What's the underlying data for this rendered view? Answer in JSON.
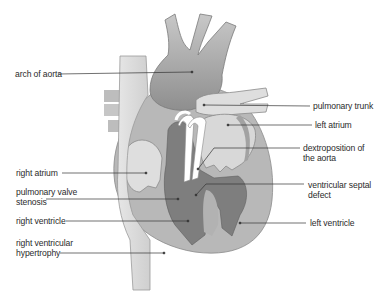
{
  "diagram": {
    "labels_left": [
      {
        "id": "arch-of-aorta",
        "line1": "arch of aorta",
        "line2": ""
      },
      {
        "id": "right-atrium",
        "line1": "right atrium",
        "line2": ""
      },
      {
        "id": "pulmonary-valve-stenosis",
        "line1": "pulmonary valve",
        "line2": "stenosis"
      },
      {
        "id": "right-ventricle",
        "line1": "right ventricle",
        "line2": ""
      },
      {
        "id": "right-ventricular-hypertrophy",
        "line1": "right ventricular",
        "line2": "hypertrophy"
      }
    ],
    "labels_right": [
      {
        "id": "pulmonary-trunk",
        "line1": "pulmonary trunk",
        "line2": ""
      },
      {
        "id": "left-atrium",
        "line1": "left atrium",
        "line2": ""
      },
      {
        "id": "dextroposition-of-aorta",
        "line1": "dextroposition of",
        "line2": "the aorta"
      },
      {
        "id": "ventricular-septal-defect",
        "line1": "ventricular septal",
        "line2": "defect"
      },
      {
        "id": "left-ventricle",
        "line1": "left ventricle",
        "line2": ""
      }
    ],
    "colors": {
      "outer_wall": "#bdbdbd",
      "aorta": "#9e9e9e",
      "chamber_light": "#dcdcdc",
      "chamber_dark": "#7c7c7c",
      "vena_cava": "#d6d6d6",
      "leader_line": "#333333"
    }
  }
}
